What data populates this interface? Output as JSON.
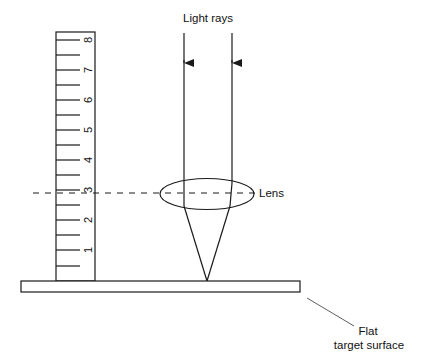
{
  "diagram": {
    "labels": {
      "light_rays": "Light rays",
      "lens": "Lens",
      "target_line1": "Flat",
      "target_line2": "target surface"
    },
    "ruler": {
      "numbers": [
        "1",
        "2",
        "3",
        "4",
        "5",
        "6",
        "7",
        "8"
      ],
      "lens_height_marker": "3"
    },
    "colors": {
      "stroke": "#1a1a1a",
      "background": "#ffffff"
    }
  }
}
